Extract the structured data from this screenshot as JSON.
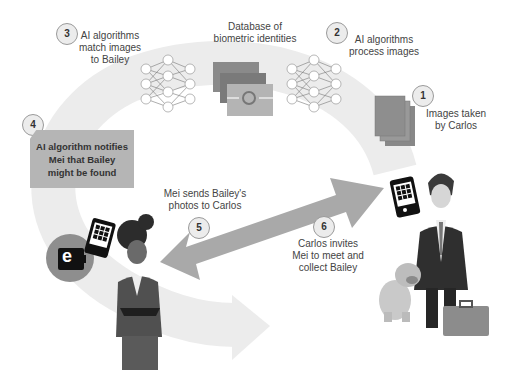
{
  "steps": [
    {
      "number": "1",
      "text": "Images taken by Carlos",
      "lines": [
        "Images taken",
        "by Carlos"
      ]
    },
    {
      "number": "2",
      "text": "AI algorithms process images",
      "lines": [
        "AI algorithms",
        "process images"
      ]
    },
    {
      "number": "3",
      "text": "AI algorithms match images to Bailey",
      "lines": [
        "AI algorithms",
        "match images",
        "to Bailey"
      ]
    },
    {
      "number": "4",
      "text": "AI algorithm notifies Mei that Bailey might be found",
      "lines": [
        "AI algorithm notifies",
        "Mei that Bailey",
        "might be found"
      ]
    },
    {
      "number": "5",
      "text": "Mei sends Bailey's photos to Carlos",
      "lines": [
        "Mei sends Bailey's",
        "photos to Carlos"
      ]
    },
    {
      "number": "6",
      "text": "Carlos invites Mei to meet and collect Bailey",
      "lines": [
        "Carlos invites",
        "Mei to meet and",
        "collect Bailey"
      ]
    }
  ],
  "database": {
    "lines": [
      "Database of",
      "biometric identities"
    ]
  },
  "wallet": {
    "glyph": "e"
  },
  "colors": {
    "arc": "#ececec",
    "arrow": "#a9a9a9",
    "photo_stack": "#8e8e8e",
    "badge_border": "#9a9a9a"
  }
}
